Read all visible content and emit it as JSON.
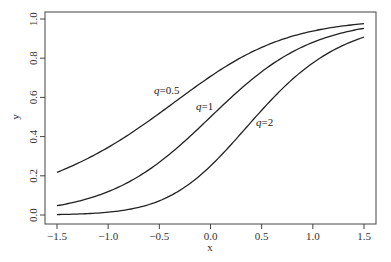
{
  "chart_data": {
    "type": "line",
    "title": "",
    "xlabel": "x",
    "ylabel": "y",
    "xlim": [
      -1.5,
      1.5
    ],
    "ylim": [
      0.0,
      1.0
    ],
    "grid": false,
    "legend": "none (inline curve labels)",
    "x_ticks": [
      -1.5,
      -1.0,
      -0.5,
      0.0,
      0.5,
      1.0,
      1.5
    ],
    "x_tick_labels": [
      "−1.5",
      "−1.0",
      "−0.5",
      "0.0",
      "0.5",
      "1.0",
      "1.5"
    ],
    "y_ticks": [
      0.0,
      0.2,
      0.4,
      0.6,
      0.8,
      1.0
    ],
    "y_tick_labels": [
      "0.0",
      "0.2",
      "0.4",
      "0.6",
      "0.8",
      "1.0"
    ],
    "x": [
      -1.5,
      -1.25,
      -1.0,
      -0.75,
      -0.5,
      -0.25,
      0.0,
      0.25,
      0.5,
      0.75,
      1.0,
      1.25,
      1.5
    ],
    "series": [
      {
        "name": "q=0.5",
        "label_var": "q",
        "label_value": "0.5",
        "values": [
          0.22,
          0.27,
          0.34,
          0.42,
          0.52,
          0.62,
          0.71,
          0.79,
          0.86,
          0.91,
          0.94,
          0.96,
          0.97
        ]
      },
      {
        "name": "q=1",
        "label_var": "q",
        "label_value": "1",
        "values": [
          0.05,
          0.08,
          0.12,
          0.18,
          0.27,
          0.38,
          0.5,
          0.62,
          0.73,
          0.82,
          0.88,
          0.92,
          0.95
        ]
      },
      {
        "name": "q=2",
        "label_var": "q",
        "label_value": "2",
        "values": [
          0.0,
          0.01,
          0.01,
          0.03,
          0.07,
          0.14,
          0.25,
          0.39,
          0.53,
          0.67,
          0.78,
          0.85,
          0.91
        ]
      }
    ],
    "annotations": [
      {
        "text": "q=0.5",
        "x": -0.3,
        "y": 0.64
      },
      {
        "text": "q=1",
        "x": -0.15,
        "y": 0.56
      },
      {
        "text": "q=2",
        "x": 0.45,
        "y": 0.47
      }
    ],
    "line_color": "#222222"
  }
}
